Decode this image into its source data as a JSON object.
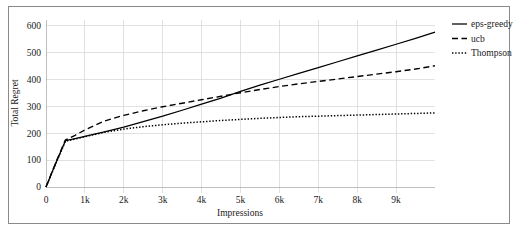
{
  "chart_data": {
    "type": "line",
    "title": "",
    "xlabel": "Impressions",
    "ylabel": "Total Regret",
    "xlim": [
      0,
      10000
    ],
    "ylim": [
      0,
      620
    ],
    "grid": true,
    "legend_position": "top-right",
    "x_ticks": [
      {
        "value": 0,
        "label": "0"
      },
      {
        "value": 1000,
        "label": "1k"
      },
      {
        "value": 2000,
        "label": "2k"
      },
      {
        "value": 3000,
        "label": "3k"
      },
      {
        "value": 4000,
        "label": "4k"
      },
      {
        "value": 5000,
        "label": "5k"
      },
      {
        "value": 6000,
        "label": "6k"
      },
      {
        "value": 7000,
        "label": "7k"
      },
      {
        "value": 8000,
        "label": "8k"
      },
      {
        "value": 9000,
        "label": "9k"
      }
    ],
    "y_ticks": [
      {
        "value": 0,
        "label": "0"
      },
      {
        "value": 100,
        "label": "100"
      },
      {
        "value": 200,
        "label": "200"
      },
      {
        "value": 300,
        "label": "300"
      },
      {
        "value": 400,
        "label": "400"
      },
      {
        "value": 500,
        "label": "500"
      },
      {
        "value": 600,
        "label": "600"
      }
    ],
    "x": [
      0,
      250,
      500,
      750,
      1000,
      1500,
      2000,
      2500,
      3000,
      3500,
      4000,
      4500,
      5000,
      5500,
      6000,
      6500,
      7000,
      7500,
      8000,
      8500,
      9000,
      9500,
      10000
    ],
    "series": [
      {
        "name": "eps-greedy",
        "style": "solid",
        "color": "#000000",
        "values": [
          0,
          88,
          172,
          180,
          188,
          205,
          222,
          243,
          263,
          285,
          308,
          330,
          355,
          378,
          400,
          422,
          443,
          465,
          487,
          508,
          530,
          552,
          575
        ]
      },
      {
        "name": "ucb",
        "style": "dashed",
        "color": "#000000",
        "values": [
          0,
          90,
          175,
          192,
          212,
          245,
          266,
          283,
          298,
          311,
          324,
          337,
          350,
          362,
          373,
          383,
          392,
          401,
          410,
          419,
          428,
          438,
          450
        ]
      },
      {
        "name": "Thompson",
        "style": "dotted",
        "color": "#000000",
        "values": [
          0,
          86,
          170,
          178,
          187,
          203,
          215,
          224,
          231,
          237,
          242,
          247,
          251,
          255,
          258,
          261,
          263,
          265,
          267,
          269,
          271,
          273,
          275
        ]
      }
    ]
  },
  "legend": {
    "items": [
      {
        "label": "eps-greedy",
        "style": "solid"
      },
      {
        "label": "ucb",
        "style": "dashed"
      },
      {
        "label": "Thompson",
        "style": "dotted"
      }
    ]
  },
  "colors": {
    "line": "#000000",
    "grid": "#d4d4d4",
    "axis": "#b0b0b0",
    "frame": "#8a8a8a",
    "background": "#ffffff"
  }
}
